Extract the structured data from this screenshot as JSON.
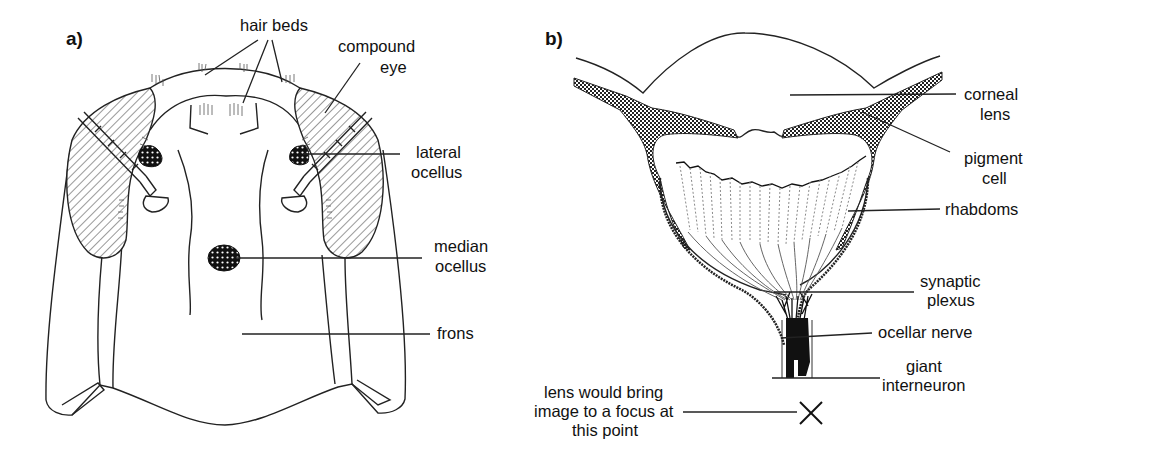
{
  "figure": {
    "panel_a": {
      "tag": "a)",
      "title": "Insect head, frontal view",
      "labels": {
        "hair_beds": "hair beds",
        "compound_eye_1": "compound",
        "compound_eye_2": "eye",
        "lateral_ocellus_1": "lateral",
        "lateral_ocellus_2": "ocellus",
        "median_ocellus_1": "median",
        "median_ocellus_2": "ocellus",
        "frons": "frons"
      }
    },
    "panel_b": {
      "tag": "b)",
      "title": "Ocellus, cross section",
      "labels": {
        "corneal_lens_1": "corneal",
        "corneal_lens_2": "lens",
        "pigment_cell_1": "pigment",
        "pigment_cell_2": "cell",
        "rhabdoms": "rhabdoms",
        "synaptic_plexus_1": "synaptic",
        "synaptic_plexus_2": "plexus",
        "ocellar_nerve": "ocellar nerve",
        "giant_interneuron_1": "giant",
        "giant_interneuron_2": "interneuron",
        "focus_1": "lens would bring",
        "focus_2": "image to a focus at",
        "focus_3": "this point"
      },
      "focus_marker": "×"
    },
    "colors": {
      "ink": "#111111",
      "background": "#ffffff",
      "hatch": "#333333",
      "rhabdom_dash": "#8a8a8a"
    }
  }
}
